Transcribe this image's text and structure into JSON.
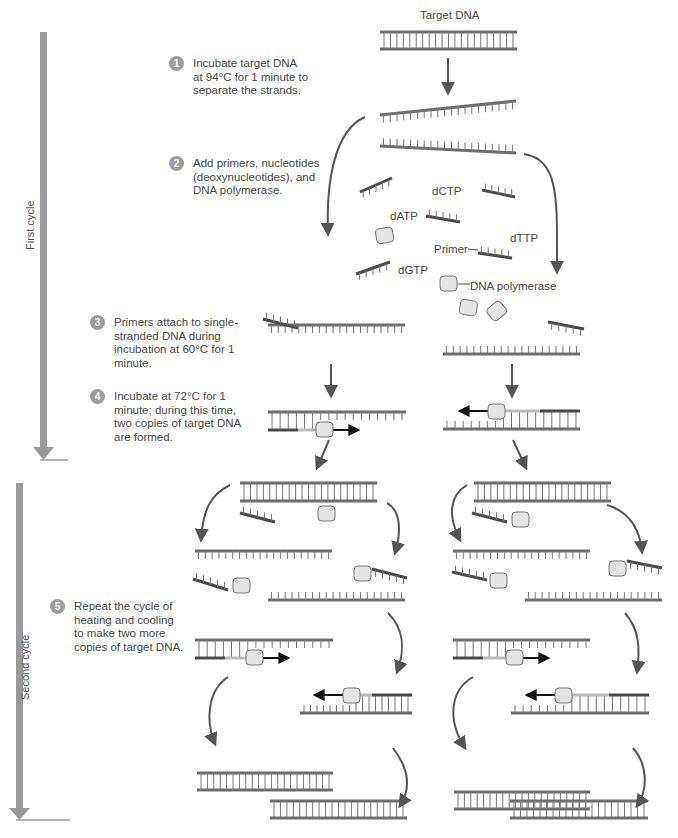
{
  "title": "Target DNA",
  "cycles": [
    {
      "label": "First cycle"
    },
    {
      "label": "Second cycle"
    }
  ],
  "steps": [
    {
      "number": "1",
      "text": "Incubate target DNA\nat 94°C for 1 minute to\nseparate the strands."
    },
    {
      "number": "2",
      "text": "Add primers, nucleotides\n(deoxynucleotides), and\nDNA polymerase."
    },
    {
      "number": "3",
      "text": "Primers attach to single-\nstranded DNA during\nincubation at 60°C for 1\nminute."
    },
    {
      "number": "4",
      "text": "Incubate at 72°C for 1\nminute; during this time,\ntwo copies of target DNA\nare formed."
    },
    {
      "number": "5",
      "text": "Repeat the cycle of\nheating and cooling\nto make two more\ncopies of target DNA."
    }
  ],
  "labels": {
    "dctp": "dCTP",
    "datp": "dATP",
    "dttp": "dTTP",
    "dgtp": "dGTP",
    "primer": "Primer",
    "dna_polymerase": "DNA polymerase"
  },
  "colors": {
    "strand": "#6f6f6f",
    "strand_light": "#b9b9b9",
    "primer": "#4a4a4a",
    "arrow": "#555555",
    "timeline": "#9a9a9a",
    "polymerase_fill": "#e4e4e4",
    "step_badge": "#9d9d9d"
  }
}
